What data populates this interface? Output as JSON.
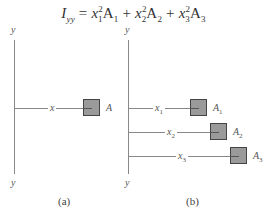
{
  "formula": {
    "lhs": "I",
    "lhs_sub": "yy",
    "equals": "=",
    "terms": [
      {
        "var": "x",
        "sub": "1",
        "sup": "2",
        "area": "A",
        "area_sub": "1"
      },
      {
        "var": "x",
        "sub": "2",
        "sup": "2",
        "area": "A",
        "area_sub": "2"
      },
      {
        "var": "x",
        "sub": "3",
        "sup": "2",
        "area": "A",
        "area_sub": "3"
      }
    ],
    "plus": "+"
  },
  "panel_a": {
    "axis_top": "y",
    "axis_bottom": "y",
    "distance_label": "x",
    "area_label": "A",
    "caption": "(a)"
  },
  "panel_b": {
    "axis_top": "y",
    "axis_bottom": "y",
    "rows": [
      {
        "distance": "x",
        "distance_sub": "1",
        "area": "A",
        "area_sub": "1"
      },
      {
        "distance": "x",
        "distance_sub": "2",
        "area": "A",
        "area_sub": "2"
      },
      {
        "distance": "x",
        "distance_sub": "3",
        "area": "A",
        "area_sub": "3"
      }
    ],
    "caption": "(b)"
  },
  "colors": {
    "area_fill": "#9a9a9a",
    "area_border": "#444444",
    "line": "#888888"
  }
}
